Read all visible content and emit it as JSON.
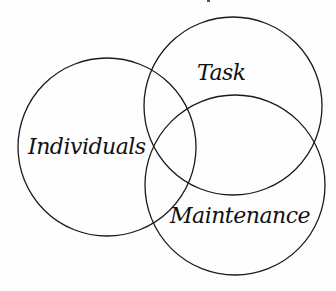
{
  "diagram": {
    "type": "venn",
    "background": "#fefefe",
    "stroke_color": "#1a1a1a",
    "sets": [
      {
        "id": "individuals",
        "label": "Individuals",
        "cx": 107,
        "cy": 147,
        "r": 89
      },
      {
        "id": "task",
        "label": "Task",
        "cx": 233,
        "cy": 106,
        "r": 89
      },
      {
        "id": "maintenance",
        "label": "Maintenance",
        "cx": 235,
        "cy": 185,
        "r": 90
      }
    ]
  }
}
